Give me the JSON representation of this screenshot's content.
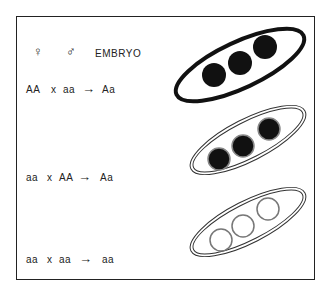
{
  "header": {
    "female_symbol": "♀",
    "male_symbol": "♂",
    "embryo_label": "EMBRYO"
  },
  "crosses": [
    {
      "female": "AA",
      "cross": "x",
      "male": "aa",
      "arrow": "→",
      "embryo": "Aa",
      "pod": "dark pod, dark seeds"
    },
    {
      "female": "aa",
      "cross": "x",
      "male": "AA",
      "arrow": "→",
      "embryo": "Aa",
      "pod": "light pod, dark seeds"
    },
    {
      "female": "aa",
      "cross": "x",
      "male": "aa",
      "arrow": "→",
      "embryo": "aa",
      "pod": "light pod, light seeds"
    }
  ]
}
